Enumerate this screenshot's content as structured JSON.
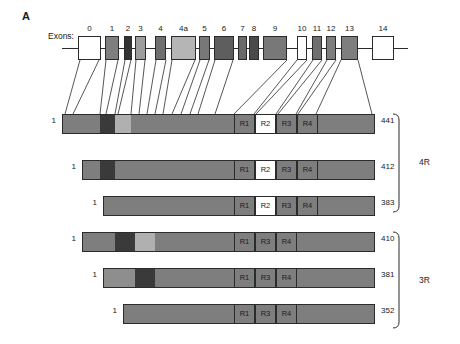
{
  "figure": {
    "panel_letter": "A",
    "exons_label": "Exons:",
    "colors": {
      "outline": "#2b2b2b",
      "white": "#ffffff",
      "light_gray": "#b9b9b9",
      "medium_gray": "#8a8a8a",
      "dark_gray": "#6f6f6f",
      "very_dark": "#3a3a3a",
      "bar_gray": "#7e7e7e"
    }
  },
  "gene": {
    "track_y": 48,
    "line_start_x": 62,
    "line_end_x": 408,
    "exons": [
      {
        "label": "0",
        "x": 78,
        "w": 23,
        "fill": "#ffffff",
        "h": 24
      },
      {
        "label": "1",
        "x": 105,
        "w": 14,
        "fill": "#7e7e7e",
        "h": 24
      },
      {
        "label": "2",
        "x": 124,
        "w": 8,
        "fill": "#333333",
        "h": 24
      },
      {
        "label": "3",
        "x": 135,
        "w": 11,
        "fill": "#9d9d9d",
        "h": 24
      },
      {
        "label": "4",
        "x": 155,
        "w": 11,
        "fill": "#6f6f6f",
        "h": 24
      },
      {
        "label": "4a",
        "x": 171,
        "w": 25,
        "fill": "#b5b5b5",
        "h": 24
      },
      {
        "label": "5",
        "x": 199,
        "w": 11,
        "fill": "#787878",
        "h": 24
      },
      {
        "label": "6",
        "x": 214,
        "w": 20,
        "fill": "#5e5e5e",
        "h": 24
      },
      {
        "label": "7",
        "x": 238,
        "w": 9,
        "fill": "#6a6a6a",
        "h": 24
      },
      {
        "label": "8",
        "x": 249,
        "w": 10,
        "fill": "#4a4a4a",
        "h": 24
      },
      {
        "label": "9",
        "x": 263,
        "w": 24,
        "fill": "#787878",
        "h": 24
      },
      {
        "label": "10",
        "x": 297,
        "w": 10,
        "fill": "#ffffff",
        "h": 24
      },
      {
        "label": "11",
        "x": 312,
        "w": 10,
        "fill": "#6f6f6f",
        "h": 24
      },
      {
        "label": "12",
        "x": 326,
        "w": 10,
        "fill": "#7e7e7e",
        "h": 24
      },
      {
        "label": "13",
        "x": 341,
        "w": 17,
        "fill": "#7e7e7e",
        "h": 24
      },
      {
        "label": "14",
        "x": 372,
        "w": 22,
        "fill": "#ffffff",
        "h": 24
      }
    ]
  },
  "isoforms": [
    {
      "name": "441",
      "start_label": "1",
      "end_label": "441",
      "x": 62,
      "w": 313,
      "y": 114,
      "h": 20,
      "group": "4R",
      "segments": [
        {
          "x": 0,
          "w": 37,
          "fill": "#7e7e7e"
        },
        {
          "x": 37,
          "w": 15,
          "fill": "#3a3a3a"
        },
        {
          "x": 52,
          "w": 16,
          "fill": "#b0b0b0"
        },
        {
          "x": 68,
          "w": 245,
          "fill": "#7e7e7e"
        }
      ],
      "repeats": [
        {
          "label": "R1",
          "x": 171,
          "w": 21,
          "fill": "#7e7e7e",
          "text": "light"
        },
        {
          "label": "R2",
          "x": 192,
          "w": 21,
          "fill": "#ffffff",
          "text": "light"
        },
        {
          "label": "R3",
          "x": 213,
          "w": 21,
          "fill": "#7e7e7e",
          "text": "light"
        },
        {
          "label": "R4",
          "x": 234,
          "w": 21,
          "fill": "#7e7e7e",
          "text": "light"
        }
      ]
    },
    {
      "name": "412",
      "start_label": "1",
      "end_label": "412",
      "x": 82,
      "w": 293,
      "y": 160,
      "h": 20,
      "group": "4R",
      "segments": [
        {
          "x": 0,
          "w": 17,
          "fill": "#7e7e7e"
        },
        {
          "x": 17,
          "w": 15,
          "fill": "#3a3a3a"
        },
        {
          "x": 32,
          "w": 261,
          "fill": "#7e7e7e"
        }
      ],
      "repeats": [
        {
          "label": "R1",
          "x": 151,
          "w": 21,
          "fill": "#7e7e7e",
          "text": "light"
        },
        {
          "label": "R2",
          "x": 172,
          "w": 21,
          "fill": "#ffffff",
          "text": "light"
        },
        {
          "label": "R3",
          "x": 193,
          "w": 21,
          "fill": "#7e7e7e",
          "text": "light"
        },
        {
          "label": "R4",
          "x": 214,
          "w": 21,
          "fill": "#7e7e7e",
          "text": "light"
        }
      ]
    },
    {
      "name": "383",
      "start_label": "1",
      "end_label": "383",
      "x": 103,
      "w": 272,
      "y": 196,
      "h": 20,
      "group": "4R",
      "segments": [
        {
          "x": 0,
          "w": 272,
          "fill": "#7e7e7e"
        }
      ],
      "repeats": [
        {
          "label": "R1",
          "x": 130,
          "w": 21,
          "fill": "#7e7e7e",
          "text": "light"
        },
        {
          "label": "R2",
          "x": 151,
          "w": 21,
          "fill": "#ffffff",
          "text": "light"
        },
        {
          "label": "R3",
          "x": 172,
          "w": 21,
          "fill": "#7e7e7e",
          "text": "light"
        },
        {
          "label": "R4",
          "x": 193,
          "w": 21,
          "fill": "#7e7e7e",
          "text": "light"
        }
      ]
    },
    {
      "name": "410",
      "start_label": "1",
      "end_label": "410",
      "x": 82,
      "w": 293,
      "y": 232,
      "h": 20,
      "group": "3R",
      "segments": [
        {
          "x": 0,
          "w": 32,
          "fill": "#7e7e7e"
        },
        {
          "x": 32,
          "w": 20,
          "fill": "#3a3a3a"
        },
        {
          "x": 52,
          "w": 20,
          "fill": "#b0b0b0"
        },
        {
          "x": 72,
          "w": 221,
          "fill": "#7e7e7e"
        }
      ],
      "repeats": [
        {
          "label": "R1",
          "x": 151,
          "w": 21,
          "fill": "#7e7e7e",
          "text": "light"
        },
        {
          "label": "R3",
          "x": 172,
          "w": 21,
          "fill": "#7e7e7e",
          "text": "light"
        },
        {
          "label": "R4",
          "x": 193,
          "w": 21,
          "fill": "#7e7e7e",
          "text": "light"
        }
      ]
    },
    {
      "name": "381",
      "start_label": "1",
      "end_label": "381",
      "x": 103,
      "w": 272,
      "y": 268,
      "h": 20,
      "group": "3R",
      "segments": [
        {
          "x": 0,
          "w": 31,
          "fill": "#8e8e8e"
        },
        {
          "x": 31,
          "w": 20,
          "fill": "#3a3a3a"
        },
        {
          "x": 51,
          "w": 221,
          "fill": "#7e7e7e"
        }
      ],
      "repeats": [
        {
          "label": "R1",
          "x": 130,
          "w": 21,
          "fill": "#7e7e7e",
          "text": "light"
        },
        {
          "label": "R3",
          "x": 151,
          "w": 21,
          "fill": "#7e7e7e",
          "text": "light"
        },
        {
          "label": "R4",
          "x": 172,
          "w": 21,
          "fill": "#7e7e7e",
          "text": "light"
        }
      ]
    },
    {
      "name": "352",
      "start_label": "1",
      "end_label": "352",
      "x": 123,
      "w": 252,
      "y": 304,
      "h": 20,
      "group": "3R",
      "segments": [
        {
          "x": 0,
          "w": 252,
          "fill": "#7e7e7e"
        }
      ],
      "repeats": [
        {
          "label": "R1",
          "x": 110,
          "w": 21,
          "fill": "#7e7e7e",
          "text": "light"
        },
        {
          "label": "R3",
          "x": 131,
          "w": 21,
          "fill": "#7e7e7e",
          "text": "light"
        },
        {
          "label": "R4",
          "x": 152,
          "w": 21,
          "fill": "#7e7e7e",
          "text": "light"
        }
      ]
    }
  ],
  "brackets": [
    {
      "label": "4R",
      "top": 114,
      "bottom": 212,
      "x": 399,
      "label_x": 419,
      "label_y": 157
    },
    {
      "label": "3R",
      "top": 232,
      "bottom": 328,
      "x": 399,
      "label_x": 419,
      "label_y": 275
    }
  ],
  "connectors": [
    {
      "from_x": 80,
      "to_x": 65
    },
    {
      "from_x": 99,
      "to_x": 73
    },
    {
      "from_x": 106,
      "to_x": 100
    },
    {
      "from_x": 118,
      "to_x": 106
    },
    {
      "from_x": 125,
      "to_x": 115
    },
    {
      "from_x": 131,
      "to_x": 118
    },
    {
      "from_x": 136,
      "to_x": 131
    },
    {
      "from_x": 145,
      "to_x": 139
    },
    {
      "from_x": 156,
      "to_x": 147
    },
    {
      "from_x": 166,
      "to_x": 155
    },
    {
      "from_x": 172,
      "to_x": 163
    },
    {
      "from_x": 195,
      "to_x": 172
    },
    {
      "from_x": 200,
      "to_x": 181
    },
    {
      "from_x": 209,
      "to_x": 190
    },
    {
      "from_x": 215,
      "to_x": 198
    },
    {
      "from_x": 233,
      "to_x": 215
    },
    {
      "from_x": 287,
      "to_x": 234
    },
    {
      "from_x": 297,
      "to_x": 254
    },
    {
      "from_x": 307,
      "to_x": 256
    },
    {
      "from_x": 313,
      "to_x": 276
    },
    {
      "from_x": 322,
      "to_x": 278
    },
    {
      "from_x": 327,
      "to_x": 296
    },
    {
      "from_x": 336,
      "to_x": 298
    },
    {
      "from_x": 341,
      "to_x": 316
    },
    {
      "from_x": 358,
      "to_x": 372
    }
  ]
}
